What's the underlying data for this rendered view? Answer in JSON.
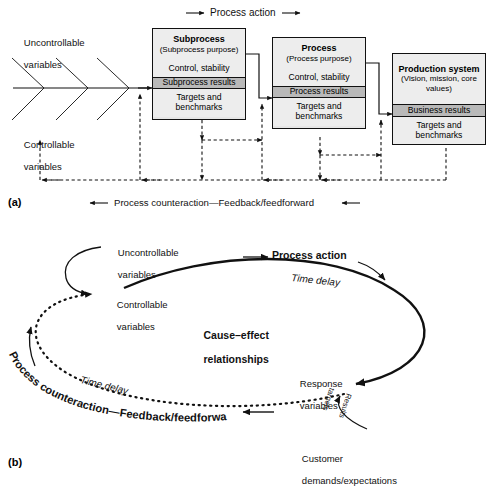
{
  "figure": {
    "panel_a_label": "(a)",
    "panel_b_label": "(b)"
  },
  "panel_a": {
    "top_arrow_label": "Process action",
    "bottom_arrow_label": "Process counteraction—Feedback/feedforward",
    "fishbone": {
      "top_label_line1": "Uncontrollable",
      "top_label_line2": "variables",
      "bottom_label_line1": "Controllable",
      "bottom_label_line2": "variables",
      "chevrons": 3
    },
    "boxes": [
      {
        "id": "subprocess",
        "title": "Subprocess",
        "subtitle": "(Subprocess purpose)",
        "rows": [
          {
            "label": "Control, stability",
            "style": "light"
          },
          {
            "label": "Subprocess results",
            "style": "dark"
          },
          {
            "label": "Targets and\nbenchmarks",
            "style": "light"
          }
        ]
      },
      {
        "id": "process",
        "title": "Process",
        "subtitle": "(Process purpose)",
        "rows": [
          {
            "label": "Control, stability",
            "style": "light"
          },
          {
            "label": "Process results",
            "style": "dark"
          },
          {
            "label": "Targets and\nbenchmarks",
            "style": "light"
          }
        ]
      },
      {
        "id": "production-system",
        "title": "Production system",
        "subtitle": "(Vision, mission, core\nvalues)",
        "rows": [
          {
            "label": "Business results",
            "style": "dark"
          },
          {
            "label": "Targets and\nbenchmarks",
            "style": "light"
          }
        ]
      }
    ]
  },
  "panel_b": {
    "uncontrollable_line1": "Uncontrollable",
    "uncontrollable_line2": "variables",
    "controllable_line1": "Controllable",
    "controllable_line2": "variables",
    "process_action": "Process action",
    "time_delay_top": "Time delay",
    "time_delay_bottom": "Time delay",
    "cause_effect_line1": "Cause–effect",
    "cause_effect_line2": "relationships",
    "response_line1": "Response",
    "response_line2": "variables",
    "counteraction": "Process counteraction—Feedback/feedforward",
    "customer_line1": "Customer",
    "customer_line2": "demands/expectations",
    "results_targets_line1": "Results",
    "results_targets_line2": "targets"
  },
  "colors": {
    "stroke": "#111111",
    "box_fill_light": "#ededed",
    "box_fill_dark": "#b9b9b9",
    "background": "#ffffff"
  }
}
